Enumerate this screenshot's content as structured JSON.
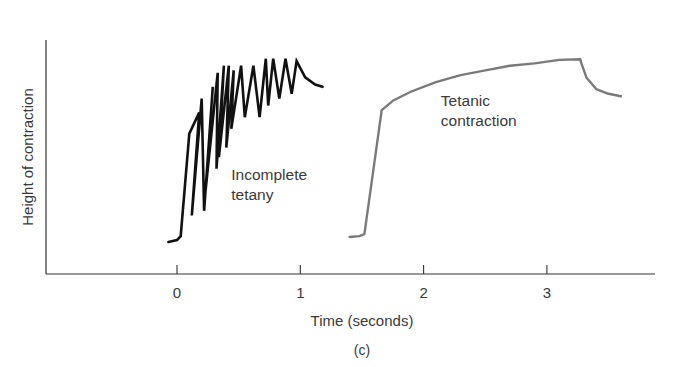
{
  "chart_data": {
    "type": "line",
    "title": "",
    "subtitle": "",
    "panel_label": "(c)",
    "xlabel": "Time (seconds)",
    "ylabel": "Height of contraction",
    "x_ticks": [
      0,
      1,
      2,
      3
    ],
    "x_tick_labels": [
      "0",
      "1",
      "2",
      "3"
    ],
    "xlim": [
      -1.06,
      3.85
    ],
    "ylim": [
      0,
      100
    ],
    "y_ticks": [],
    "grid": false,
    "legend": null,
    "annotations": [
      {
        "text_lines": [
          "Incomplete",
          "tetany"
        ],
        "x": 0.44,
        "y": 40,
        "series": "Incomplete tetany"
      },
      {
        "text_lines": [
          "Tetanic",
          "contraction"
        ],
        "x": 2.14,
        "y": 72,
        "series": "Tetanic contraction"
      }
    ],
    "series": [
      {
        "name": "Incomplete tetany",
        "color": "#111111",
        "x": [
          -0.07,
          0.0,
          0.03,
          0.1,
          0.18,
          0.12,
          0.2,
          0.22,
          0.29,
          0.23,
          0.33,
          0.32,
          0.38,
          0.34,
          0.42,
          0.4,
          0.46,
          0.44,
          0.52,
          0.55,
          0.62,
          0.67,
          0.72,
          0.74,
          0.78,
          0.83,
          0.88,
          0.93,
          0.97,
          1.04,
          1.12,
          1.18
        ],
        "y": [
          13.7,
          14.5,
          16.2,
          60,
          69,
          25,
          75,
          27,
          80,
          35,
          86,
          45,
          89,
          50,
          89,
          54,
          87,
          62,
          89,
          67,
          89,
          67,
          92,
          72,
          92,
          75,
          92,
          77,
          91,
          84,
          81,
          80
        ],
        "points": [
          {
            "t": -0.07,
            "h": 13.7
          },
          {
            "t": 0.03,
            "h": 16.2
          },
          {
            "t": 0.18,
            "h": 69
          },
          {
            "t": 0.12,
            "h": 25
          },
          {
            "t": 0.2,
            "h": 75
          },
          {
            "t": 0.22,
            "h": 27
          },
          {
            "t": 0.29,
            "h": 80
          },
          {
            "t": 0.23,
            "h": 35
          },
          {
            "t": 0.33,
            "h": 86
          },
          {
            "t": 0.32,
            "h": 45
          },
          {
            "t": 0.38,
            "h": 89
          },
          {
            "t": 0.34,
            "h": 50
          },
          {
            "t": 0.42,
            "h": 89
          },
          {
            "t": 0.4,
            "h": 54
          },
          {
            "t": 0.46,
            "h": 87
          },
          {
            "t": 0.44,
            "h": 62
          },
          {
            "t": 0.52,
            "h": 89
          },
          {
            "t": 0.55,
            "h": 67
          },
          {
            "t": 0.62,
            "h": 89
          },
          {
            "t": 0.67,
            "h": 67
          },
          {
            "t": 0.72,
            "h": 92
          },
          {
            "t": 0.74,
            "h": 72
          },
          {
            "t": 0.78,
            "h": 92
          },
          {
            "t": 0.83,
            "h": 75
          },
          {
            "t": 0.88,
            "h": 92
          },
          {
            "t": 0.93,
            "h": 77
          },
          {
            "t": 0.97,
            "h": 91
          },
          {
            "t": 1.18,
            "h": 80
          }
        ]
      },
      {
        "name": "Tetanic contraction",
        "color": "#7a7a7a",
        "x": [
          1.4,
          1.48,
          1.52,
          1.66,
          1.75,
          1.9,
          2.1,
          2.3,
          2.5,
          2.7,
          2.9,
          3.1,
          3.27,
          3.28,
          3.32,
          3.4,
          3.5,
          3.6
        ],
        "y": [
          15.8,
          16.2,
          17,
          70,
          74,
          78,
          82,
          85,
          87,
          89,
          90,
          91.5,
          91.8,
          90,
          84,
          79,
          77,
          76
        ],
        "points": [
          {
            "t": 1.4,
            "h": 15.8
          },
          {
            "t": 1.52,
            "h": 17
          },
          {
            "t": 1.66,
            "h": 70
          },
          {
            "t": 1.9,
            "h": 78
          },
          {
            "t": 2.3,
            "h": 85
          },
          {
            "t": 2.7,
            "h": 89
          },
          {
            "t": 3.1,
            "h": 91.5
          },
          {
            "t": 3.27,
            "h": 91.8
          },
          {
            "t": 3.4,
            "h": 79
          },
          {
            "t": 3.6,
            "h": 76
          }
        ]
      }
    ]
  },
  "layout": {
    "plot": {
      "x0": 46,
      "x_zero_px": 177,
      "px_per_second": 123.3,
      "y_axis_top": 40,
      "y_axis_bottom": 274,
      "x_axis_right": 655,
      "px_per_unit_y": 2.34
    }
  }
}
